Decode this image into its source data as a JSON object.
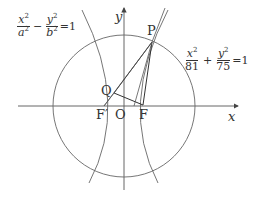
{
  "diagram": {
    "axes": {
      "x_label": "x",
      "y_label": "y",
      "origin_label": "O"
    },
    "points": {
      "P": "P",
      "Q": "Q",
      "F": "F",
      "F_prime": "F′"
    },
    "equations": {
      "hyperbola": {
        "term1_num": "x",
        "term1_den": "a",
        "op": "−",
        "term2_num": "y",
        "term2_den": "b",
        "rhs": "=1",
        "exp": "2"
      },
      "ellipse": {
        "term1_num": "x",
        "term1_den": "81",
        "op": "+",
        "term2_num": "y",
        "term2_den": "75",
        "rhs": "=1",
        "exp": "2"
      }
    },
    "colors": {
      "stroke": "#555555",
      "text": "#333333"
    }
  }
}
